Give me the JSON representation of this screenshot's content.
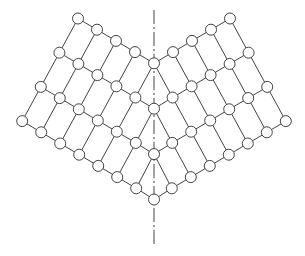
{
  "diagram": {
    "type": "symmetric-lattice-net",
    "colors": {
      "background": "#ffffff",
      "stroke": "#444444",
      "node_fill": "#ffffff"
    },
    "axis": {
      "x": 154,
      "y_top": 10,
      "y_bottom": 244,
      "style": "dash-dot"
    },
    "lattice": {
      "origin": [
        78,
        18.5
      ],
      "row_step": [
        19,
        11.2
      ],
      "col_step": [
        -18.6,
        34.2
      ],
      "rows": 4,
      "base_row_length": 5,
      "mirror_x": 154
    },
    "node_radius": 5.5,
    "node_count": 41
  }
}
